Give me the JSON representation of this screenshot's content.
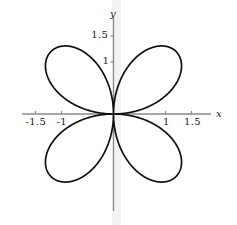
{
  "figure": {
    "background_color": "#ffffff",
    "curve_color": "#101010",
    "axis_color": "#8a8a8a",
    "band_color": "#f2f2f2",
    "text_color": "#1a1a1a"
  },
  "axes": {
    "x_axis_label": "x",
    "y_axis_label": "y",
    "x_ticks": [
      {
        "value": -1.5,
        "label": "-1.5"
      },
      {
        "value": -1,
        "label": "-1"
      },
      {
        "value": 1,
        "label": "1"
      },
      {
        "value": 1.5,
        "label": "1.5"
      }
    ],
    "y_ticks": [
      {
        "value": 1.5,
        "label": "1.5"
      },
      {
        "value": 1,
        "label": "1"
      }
    ]
  },
  "chart_data": {
    "type": "line",
    "title": "",
    "xlabel": "x",
    "ylabel": "y",
    "plot_kind": "polar-rose",
    "equation": "r = 1.7 cos(2(theta - 45deg))",
    "petal_count": 4,
    "petal_max_radius": 1.7,
    "petal_angles_deg": [
      45,
      135,
      225,
      315
    ],
    "xlim": [
      -1.95,
      1.85
    ],
    "ylim": [
      -1.85,
      1.95
    ],
    "xticks": [
      -1.5,
      -1,
      1,
      1.5
    ],
    "yticks": [
      1,
      1.5
    ],
    "grid": false,
    "legend": null,
    "series": [
      {
        "name": "rose",
        "parametric": "x = r cos(theta), y = r sin(theta)",
        "r_of_theta": [
          {
            "theta_deg": 0,
            "r": 0.0
          },
          {
            "theta_deg": 15,
            "r": 0.88
          },
          {
            "theta_deg": 30,
            "r": 1.47
          },
          {
            "theta_deg": 45,
            "r": 1.7
          },
          {
            "theta_deg": 60,
            "r": 1.47
          },
          {
            "theta_deg": 75,
            "r": 0.88
          },
          {
            "theta_deg": 90,
            "r": 0.0
          },
          {
            "theta_deg": 105,
            "r": 0.88
          },
          {
            "theta_deg": 120,
            "r": 1.47
          },
          {
            "theta_deg": 135,
            "r": 1.7
          },
          {
            "theta_deg": 150,
            "r": 1.47
          },
          {
            "theta_deg": 165,
            "r": 0.88
          },
          {
            "theta_deg": 180,
            "r": 0.0
          },
          {
            "theta_deg": 195,
            "r": 0.88
          },
          {
            "theta_deg": 210,
            "r": 1.47
          },
          {
            "theta_deg": 225,
            "r": 1.7
          },
          {
            "theta_deg": 240,
            "r": 1.47
          },
          {
            "theta_deg": 255,
            "r": 0.88
          },
          {
            "theta_deg": 270,
            "r": 0.0
          },
          {
            "theta_deg": 285,
            "r": 0.88
          },
          {
            "theta_deg": 300,
            "r": 1.47
          },
          {
            "theta_deg": 315,
            "r": 1.7
          },
          {
            "theta_deg": 330,
            "r": 1.47
          },
          {
            "theta_deg": 345,
            "r": 0.88
          },
          {
            "theta_deg": 360,
            "r": 0.0
          }
        ]
      }
    ]
  }
}
